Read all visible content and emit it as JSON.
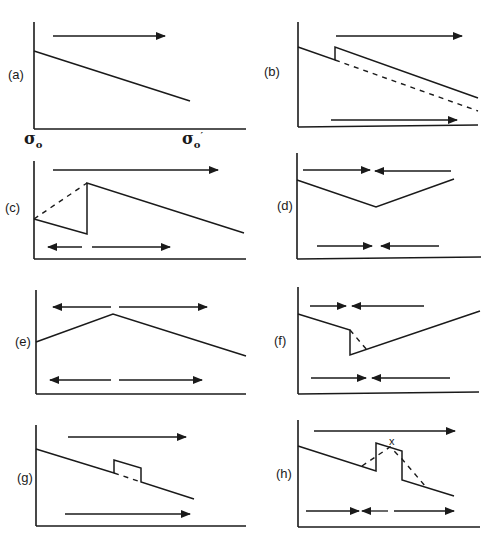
{
  "figure": {
    "panels": [
      {
        "id": "a",
        "label": "(a)",
        "x_axis_start": "σ",
        "x_axis_start_sub": "o",
        "x_axis_end": "σ",
        "x_axis_end_sub": "o",
        "x_axis_end_prime": "′",
        "arrows": [
          "right"
        ],
        "features": "linear descending line"
      },
      {
        "id": "b",
        "label": "(b)",
        "arrows": [
          "right (top)",
          "right (bottom)"
        ],
        "features": "descending line with upward step; dashed continuation of original line"
      },
      {
        "id": "c",
        "label": "(c)",
        "arrows": [
          "right (top)",
          "left and right (bottom)"
        ],
        "features": "descending line with vertical jump, dashed rising line"
      },
      {
        "id": "d",
        "label": "(d)",
        "arrows": [
          "converging (top)",
          "converging (bottom)"
        ],
        "features": "V-shaped profile"
      },
      {
        "id": "e",
        "label": "(e)",
        "arrows": [
          "diverging (top)",
          "diverging (bottom)"
        ],
        "features": "inverted-V profile"
      },
      {
        "id": "f",
        "label": "(f)",
        "arrows": [
          "converging (top)",
          "converging (bottom)"
        ],
        "features": "descending line, vertical drop, then rising line with dashed diagonal"
      },
      {
        "id": "g",
        "label": "(g)",
        "arrows": [
          "right (top)",
          "right (bottom)"
        ],
        "features": "descending line with raised rectangular pulse and dashed baseline"
      },
      {
        "id": "h",
        "label": "(h)",
        "annotation": "x",
        "arrows": [
          "right (top)",
          "converging then right (bottom)"
        ],
        "features": "descending line with raised pulse and dashed triangular peak"
      }
    ]
  }
}
